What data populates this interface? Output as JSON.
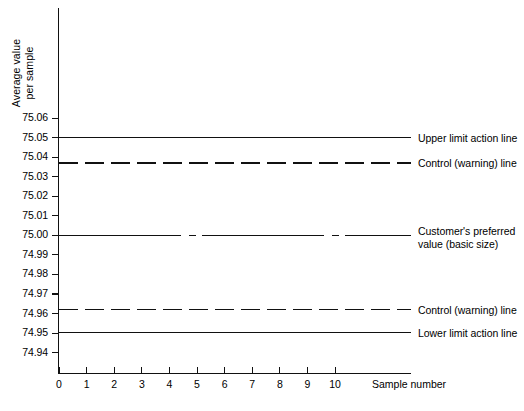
{
  "chart_data": {
    "type": "line",
    "title": "",
    "xlabel": "Sample number",
    "ylabel": "Average value\nper sample",
    "xlim": [
      0,
      10
    ],
    "ylim": [
      74.935,
      75.065
    ],
    "x_ticks": [
      0,
      1,
      2,
      3,
      4,
      5,
      6,
      7,
      8,
      9,
      10
    ],
    "y_ticks": [
      75.06,
      75.05,
      75.04,
      75.03,
      75.02,
      75.01,
      75.0,
      74.99,
      74.98,
      74.97,
      74.96,
      74.95,
      74.94
    ],
    "y_tick_labels": [
      "75.06",
      "75.05",
      "75.04",
      "75.03",
      "75.02",
      "75.01",
      "75.00",
      "74.99",
      "74.98",
      "74.97",
      "74.96",
      "74.95",
      "74.94"
    ],
    "grid": false,
    "legend_position": "right-inline-annotations",
    "series": [
      {
        "name": "Upper limit action line",
        "value": 75.05,
        "style": "solid",
        "label": "Upper limit action line",
        "values": [
          75.05,
          75.05,
          75.05,
          75.05,
          75.05,
          75.05,
          75.05,
          75.05,
          75.05,
          75.05,
          75.05
        ]
      },
      {
        "name": "Control (warning) line upper",
        "value": 75.037,
        "style": "dashed",
        "label": "Control (warning) line",
        "values": [
          75.037,
          75.037,
          75.037,
          75.037,
          75.037,
          75.037,
          75.037,
          75.037,
          75.037,
          75.037,
          75.037
        ]
      },
      {
        "name": "Customer's preferred value (basic size)",
        "value": 75.0,
        "style": "broken",
        "label": "Customer's preferred\nvalue (basic size)",
        "values": [
          75.0,
          75.0,
          75.0,
          75.0,
          75.0,
          75.0,
          75.0,
          75.0,
          75.0,
          75.0,
          75.0
        ]
      },
      {
        "name": "Control (warning) line lower",
        "value": 74.962,
        "style": "dashed",
        "label": "Control (warning) line",
        "values": [
          74.962,
          74.962,
          74.962,
          74.962,
          74.962,
          74.962,
          74.962,
          74.962,
          74.962,
          74.962,
          74.962
        ]
      },
      {
        "name": "Lower limit action line",
        "value": 74.95,
        "style": "solid",
        "label": "Lower limit action line",
        "values": [
          74.95,
          74.95,
          74.95,
          74.95,
          74.95,
          74.95,
          74.95,
          74.95,
          74.95,
          74.95,
          74.95
        ]
      }
    ],
    "colors": {
      "line": "#111111",
      "background": "#ffffff",
      "axis": "#111111"
    }
  }
}
